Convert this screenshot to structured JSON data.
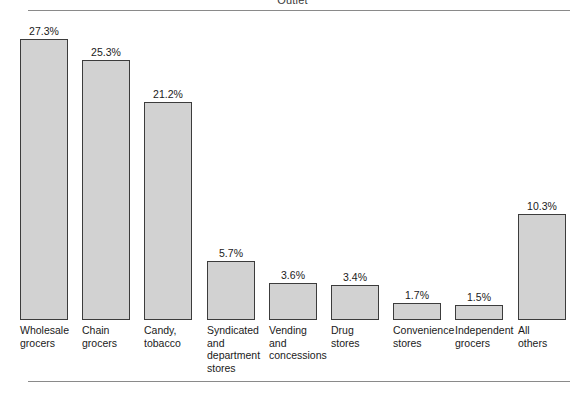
{
  "figure": {
    "title": "Outlet",
    "baseline_y": 320,
    "top_rule_y": 10,
    "bottom_rule_y": 381
  },
  "style": {
    "bar_fill": "#d2d2d2",
    "bar_border": "#3c3c3c",
    "rule_color": "#8a8a8a",
    "text_color": "#1a1a1a"
  },
  "chart_data": {
    "type": "bar",
    "title": "Outlet",
    "xlabel": "",
    "ylabel": "",
    "ylim": [
      0,
      27.3
    ],
    "grid": false,
    "legend": null,
    "value_suffix": "%",
    "categories": [
      "Wholesale grocers",
      "Chain grocers",
      "Candy, tobacco",
      "Syndicated and department stores",
      "Vending and concessions",
      "Drug stores",
      "Convenience stores",
      "Independent grocers",
      "All others"
    ],
    "values": [
      27.3,
      25.3,
      21.2,
      5.7,
      3.6,
      3.4,
      1.7,
      1.5,
      10.3
    ],
    "value_labels": [
      "27.3%",
      "25.3%",
      "21.2%",
      "5.7%",
      "3.6%",
      "3.4%",
      "1.7%",
      "1.5%",
      "10.3%"
    ],
    "tick_labels": [
      [
        "Wholesale",
        "grocers"
      ],
      [
        "Chain",
        "grocers"
      ],
      [
        "Candy,",
        "tobacco"
      ],
      [
        "Syndicated",
        "and",
        "department",
        "stores"
      ],
      [
        "Vending",
        "and",
        "concessions"
      ],
      [
        "Drug",
        "stores"
      ],
      [
        "Convenience",
        "stores"
      ],
      [
        "Independent",
        "grocers"
      ],
      [
        "All",
        "others"
      ]
    ]
  }
}
